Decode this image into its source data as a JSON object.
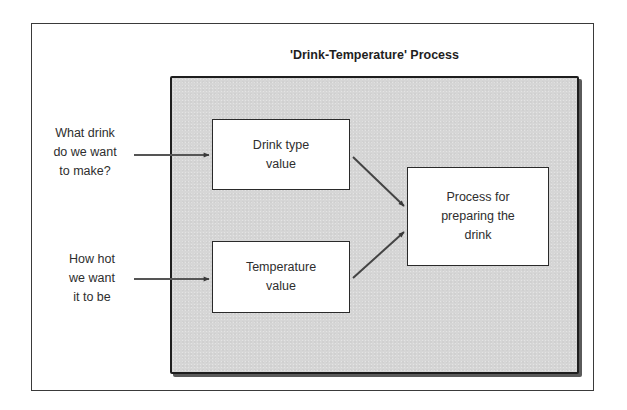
{
  "diagram": {
    "title": "'Drink-Temperature' Process",
    "inputs": [
      {
        "label": "What drink\ndo we want\nto make?"
      },
      {
        "label": "How hot\nwe want\nit to be"
      }
    ],
    "boxes": {
      "drink_type": "Drink type\nvalue",
      "temperature": "Temperature\nvalue",
      "process": "Process for\npreparing the\ndrink"
    },
    "edges": [
      {
        "from": "What drink do we want to make?",
        "to": "Drink type value"
      },
      {
        "from": "How hot we want it to be",
        "to": "Temperature value"
      },
      {
        "from": "Drink type value",
        "to": "Process for preparing the drink"
      },
      {
        "from": "Temperature value",
        "to": "Process for preparing the drink"
      }
    ],
    "colors": {
      "process_area_fill": "#d6d6d6",
      "border": "#1e1e1e",
      "box_fill": "#ffffff",
      "text": "#2e2e2e"
    }
  }
}
